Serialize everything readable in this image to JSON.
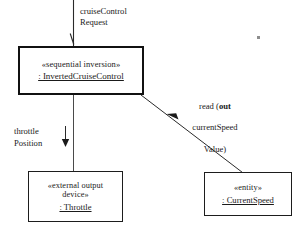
{
  "diagram": {
    "background": "#ffffff",
    "line_color": "#1d1d1d",
    "text_color": "#1a1a1a"
  },
  "boxes": {
    "inverted_cruise_control": {
      "stereotype": "«sequential inversion»",
      "instance": ": InvertedCruiseControl"
    },
    "throttle": {
      "stereotype": "«external output\ndevice»",
      "instance": ": Throttle"
    },
    "current_speed": {
      "stereotype": "«entity»",
      "instance": ": CurrentSpeed"
    }
  },
  "labels": {
    "cruise_control_request": "cruiseControl\nRequest",
    "throttle_position": "throttle\nPosition",
    "read_current_speed": {
      "line1_pre": "read (",
      "line1_keyword": "out",
      "line2": "currentSpeed",
      "line3": "Value)"
    }
  },
  "connectors": [
    {
      "name": "cruise-control-request-arrow",
      "from": "external-top",
      "to": "inverted-cruise-control",
      "arrowhead": "open",
      "direction": "down"
    },
    {
      "name": "throttle-position-arrow",
      "from": "inverted-cruise-control",
      "to": "throttle",
      "arrowhead": "filled",
      "direction": "down"
    },
    {
      "name": "read-current-speed-arrow",
      "from": "current-speed",
      "to": "inverted-cruise-control",
      "arrowhead": "filled",
      "direction": "up-left"
    }
  ]
}
